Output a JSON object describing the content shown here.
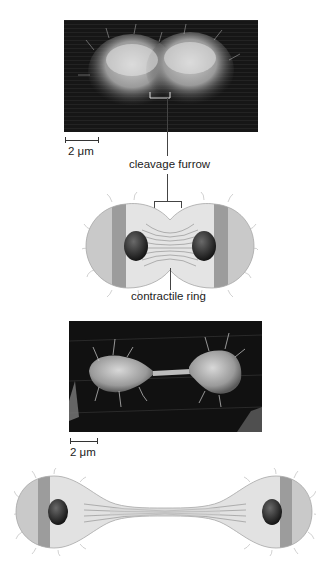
{
  "figure": {
    "panel_a": {
      "photo": "scanning electron micrograph of cell undergoing cleavage",
      "scale_label": "2 μm",
      "annotation": "cleavage furrow"
    },
    "diagram_a": {
      "description": "drawing of dividing cell with contractile ring",
      "annotation": "contractile ring"
    },
    "panel_b": {
      "photo": "scanning electron micrograph of two daughter cells joined by a thin bridge",
      "scale_label": "2 μm"
    },
    "diagram_b": {
      "description": "drawing of two daughter cells connected by a thin midbody bridge"
    }
  },
  "colors": {
    "photo_bg": "#1a1a1a",
    "cell_light": "#d9d9d9",
    "cell_band": "#9a9a9a",
    "nucleus": "#2a2a2a",
    "label": "#222222"
  }
}
